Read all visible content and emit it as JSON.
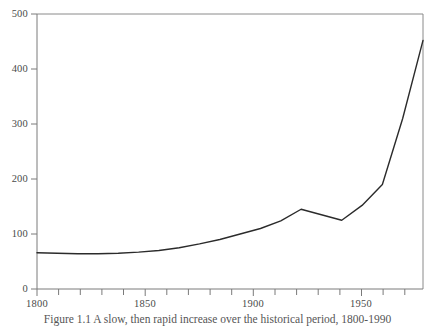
{
  "chart_data": {
    "type": "line",
    "title": "",
    "subtitle": "",
    "xlabel": "",
    "ylabel": "",
    "xlim": [
      1800,
      1990
    ],
    "ylim": [
      0,
      500
    ],
    "grid": false,
    "legend": null,
    "legend_position": "none",
    "line_color": "#2b2b2b",
    "axis_color": "#7a7a7a",
    "background": "#ffffff",
    "x_ticks_major": [
      1800,
      1850,
      1900,
      1950
    ],
    "x_tick_labels": [
      "1800",
      "1850",
      "1900",
      "1950"
    ],
    "x_ticks_minor_step": 10,
    "y_ticks": [
      0,
      100,
      200,
      300,
      400,
      500
    ],
    "y_tick_labels": [
      "0",
      "100",
      "200",
      "300",
      "400",
      "500"
    ],
    "series": [
      {
        "name": "value",
        "x": [
          1800,
          1810,
          1820,
          1830,
          1840,
          1850,
          1860,
          1870,
          1880,
          1890,
          1900,
          1910,
          1920,
          1930,
          1940,
          1950,
          1960,
          1970,
          1980,
          1990
        ],
        "values": [
          66,
          65,
          64,
          64,
          65,
          67,
          70,
          75,
          82,
          90,
          100,
          110,
          124,
          145,
          135,
          125,
          152,
          190,
          310,
          452
        ]
      }
    ]
  },
  "caption": {
    "text": "Figure 1.1  A slow, then rapid increase over the historical period, 1800-1990"
  }
}
